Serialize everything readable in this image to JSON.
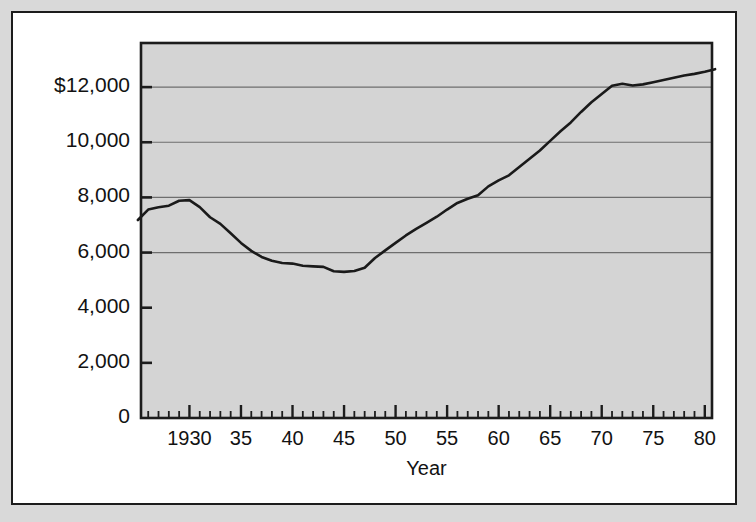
{
  "figure": {
    "background_color": "#d9d9d9",
    "panel_color": "#ffffff",
    "plot_fill_color": "#d4d4d4",
    "line_color": "#1a1a1a",
    "grid_color": "#6e6e6e",
    "axis_color": "#1c1c1c"
  },
  "chart_data": {
    "type": "line",
    "title": "",
    "subtitle": "",
    "xlabel": "Year",
    "ylabel": "",
    "grid": "horizontal-major-only",
    "legend": "none",
    "xlim": [
      1925.3,
      1980.7
    ],
    "ylim": [
      0,
      13600
    ],
    "ytick_labels": [
      "$12,000",
      "10,000",
      "8,000",
      "6,000",
      "4,000",
      "2,000",
      "0"
    ],
    "ytick_values": [
      12000,
      10000,
      8000,
      6000,
      4000,
      2000,
      0
    ],
    "gridline_values": [
      12000,
      10000,
      8000,
      6000
    ],
    "xtick_labels": [
      "1930",
      "35",
      "40",
      "45",
      "50",
      "55",
      "60",
      "65",
      "70",
      "75",
      "80"
    ],
    "xtick_values": [
      1930,
      1935,
      1940,
      1945,
      1950,
      1955,
      1960,
      1965,
      1970,
      1975,
      1980
    ],
    "x_minor_tick_interval": 1,
    "x_major_tick_interval": 5,
    "x": [
      1925,
      1926,
      1927,
      1928,
      1929,
      1930,
      1931,
      1932,
      1933,
      1934,
      1935,
      1936,
      1937,
      1938,
      1939,
      1940,
      1941,
      1942,
      1943,
      1944,
      1945,
      1946,
      1947,
      1948,
      1949,
      1950,
      1951,
      1952,
      1953,
      1954,
      1955,
      1956,
      1957,
      1958,
      1959,
      1960,
      1961,
      1962,
      1963,
      1964,
      1965,
      1966,
      1967,
      1968,
      1969,
      1970,
      1971,
      1972,
      1973,
      1974,
      1975,
      1976,
      1977,
      1978,
      1979,
      1980,
      1981
    ],
    "values": [
      7180,
      7560,
      7640,
      7700,
      7880,
      7900,
      7650,
      7280,
      7040,
      6700,
      6350,
      6060,
      5840,
      5700,
      5620,
      5600,
      5520,
      5500,
      5480,
      5320,
      5300,
      5330,
      5450,
      5800,
      6080,
      6350,
      6620,
      6860,
      7080,
      7300,
      7560,
      7800,
      7950,
      8080,
      8400,
      8620,
      8800,
      9100,
      9400,
      9700,
      10050,
      10400,
      10720,
      11100,
      11450,
      11750,
      12050,
      12120,
      12060,
      12100,
      12180,
      12260,
      12340,
      12420,
      12480,
      12560,
      12650
    ],
    "annotations": []
  }
}
